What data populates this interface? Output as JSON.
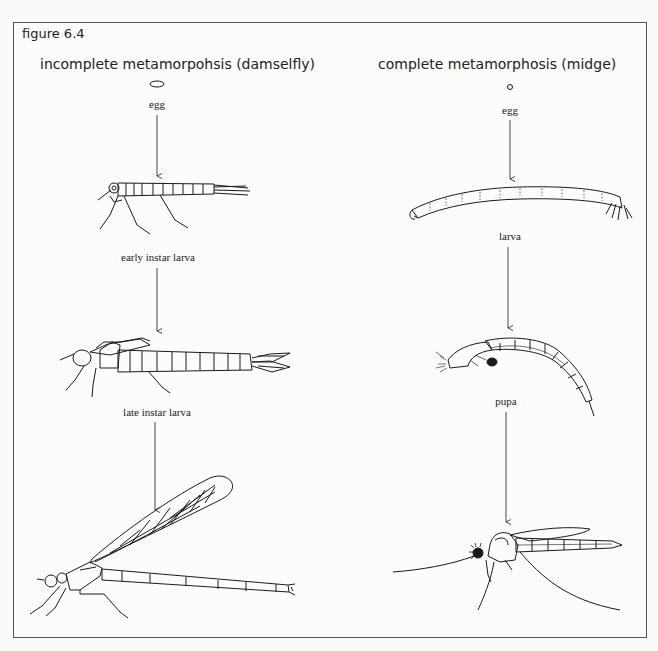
{
  "figure": {
    "label": "figure 6.4",
    "columns": [
      {
        "title": "incomplete metamorpohsis (damselfly)",
        "stages": [
          {
            "label": "egg",
            "icon": "egg-oval-icon"
          },
          {
            "label": "early instar larva",
            "icon": "damselfly-early-larva-icon"
          },
          {
            "label": "late instar larva",
            "icon": "damselfly-late-larva-icon"
          },
          {
            "label": "",
            "icon": "adult-damselfly-icon"
          }
        ]
      },
      {
        "title": "complete metamorphosis (midge)",
        "stages": [
          {
            "label": "egg",
            "icon": "egg-round-icon"
          },
          {
            "label": "larva",
            "icon": "midge-larva-icon"
          },
          {
            "label": "pupa",
            "icon": "midge-pupa-icon"
          },
          {
            "label": "",
            "icon": "adult-midge-icon"
          }
        ]
      }
    ]
  },
  "colors": {
    "line": "#1a1a1a",
    "frame": "#555555",
    "background": "#fcfcfb"
  }
}
